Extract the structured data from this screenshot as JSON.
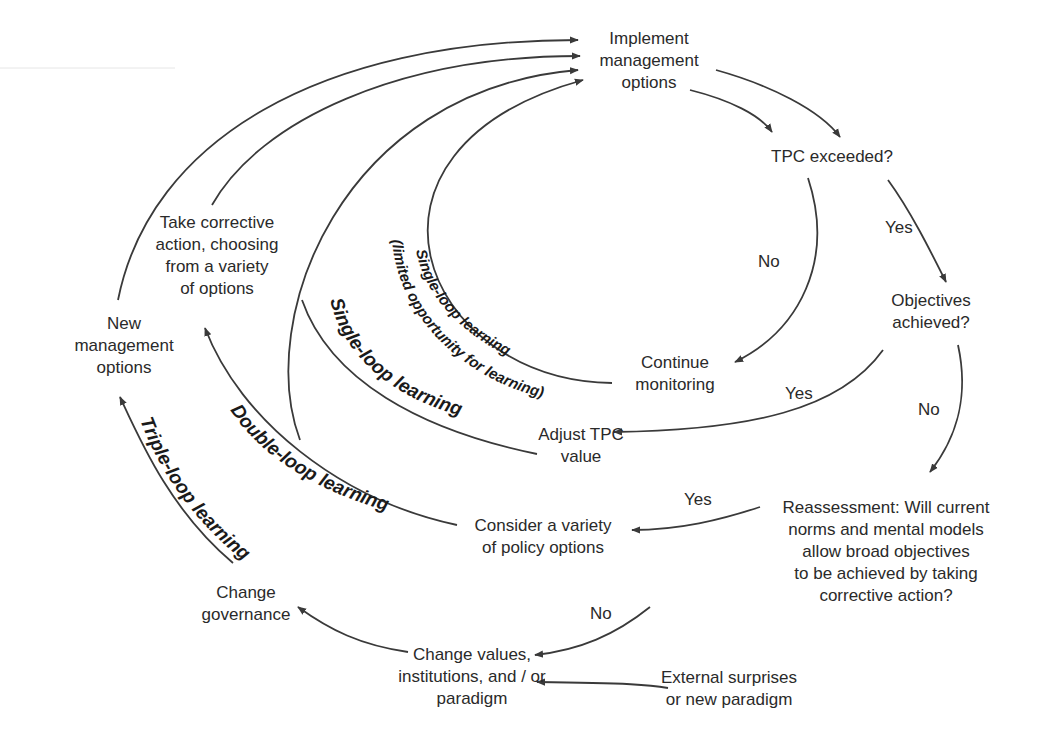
{
  "diagram": {
    "nodes": {
      "implement": [
        "Implement",
        "management",
        "options"
      ],
      "tpc_exceeded": [
        "TPC exceeded?"
      ],
      "objectives": [
        "Objectives",
        "achieved?"
      ],
      "continue": [
        "Continue",
        "monitoring"
      ],
      "adjust": [
        "Adjust TPC",
        "value"
      ],
      "reassessment": [
        "Reassessment:  Will current",
        "norms and mental models",
        "allow broad objectives",
        "to be achieved by taking",
        "corrective action?"
      ],
      "consider": [
        "Consider a variety",
        "of policy options"
      ],
      "take_action": [
        "Take corrective",
        "action, choosing",
        "from a variety",
        "of options"
      ],
      "new_options": [
        "New",
        "management",
        "options"
      ],
      "change_values": [
        "Change values,",
        "institutions, and / or",
        "paradigm"
      ],
      "external": [
        "External surprises",
        "or new paradigm"
      ],
      "governance": [
        "Change",
        "governance"
      ]
    },
    "edge_labels": {
      "no_tpc": "No",
      "yes_tpc": "Yes",
      "yes_obj": "Yes",
      "no_obj": "No",
      "yes_reassess": "Yes",
      "no_reassess": "No"
    },
    "loops": {
      "single_limited_1": "Single-loop learning",
      "single_limited_2": "(limited opportunity for learning)",
      "single": "Single-loop learning",
      "double": "Double-loop learning",
      "triple": "Triple-loop learning"
    },
    "colors": {
      "line": "#3a3a3a",
      "text": "#2a2a2a"
    }
  }
}
